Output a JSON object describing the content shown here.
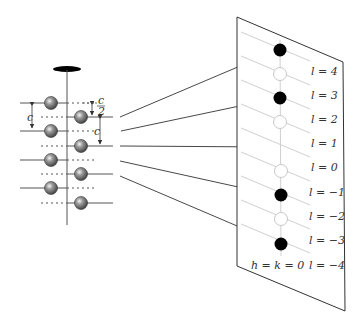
{
  "figure": {
    "type": "crystal-diffraction-schematic",
    "colors": {
      "line": "#333333",
      "grid": "#cfcfcf",
      "spot_filled": "#000000",
      "spot_open_stroke": "#c8c8c8",
      "atom_dark": "#555555",
      "atom_light": "#f2f2f2"
    }
  },
  "crystal": {
    "spacing_label": "c",
    "half_spacing_label_num": "c",
    "half_spacing_label_den": "2",
    "left_atoms_y": [
      103,
      131,
      160,
      188
    ],
    "right_atoms_y": [
      117,
      146,
      174,
      203
    ]
  },
  "screen": {
    "zone_label": "h = k = 0",
    "rows": [
      {
        "label": "l = 4",
        "spot": "filled"
      },
      {
        "label": "l = 3",
        "spot": "open"
      },
      {
        "label": "l = 2",
        "spot": "filled"
      },
      {
        "label": "l = 1",
        "spot": "open"
      },
      {
        "label": "l = 0",
        "spot": "none"
      },
      {
        "label": "l = −1",
        "spot": "open"
      },
      {
        "label": "l = −2",
        "spot": "filled"
      },
      {
        "label": "l = −3",
        "spot": "open"
      },
      {
        "label": "l = −4",
        "spot": "filled"
      }
    ]
  }
}
